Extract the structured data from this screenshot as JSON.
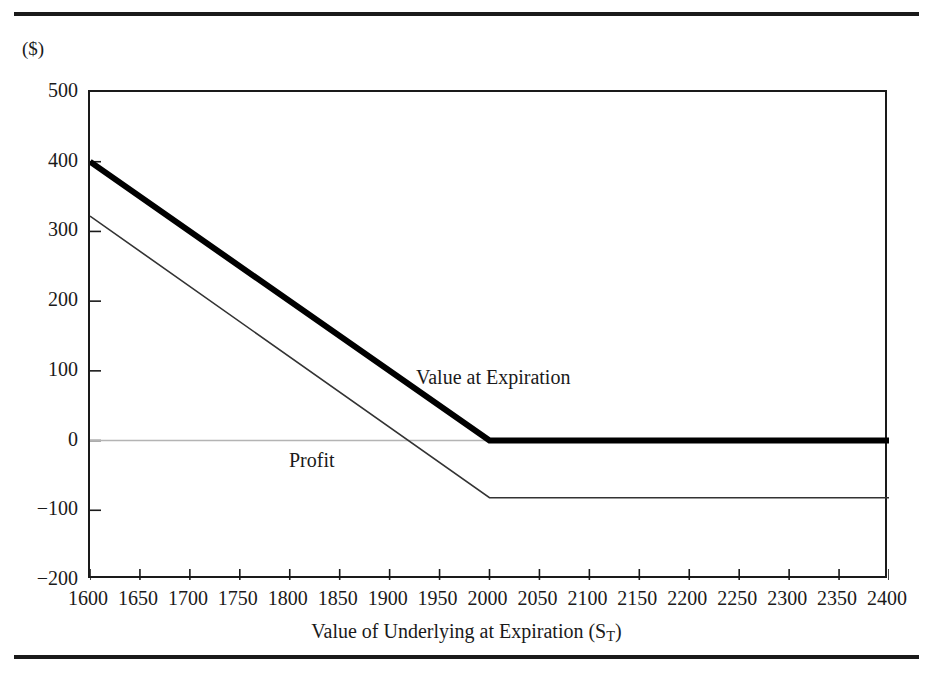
{
  "figure": {
    "clipped_title": "Exhibit  Short Call",
    "unit_label": "($)"
  },
  "chart_data": {
    "type": "line",
    "title": "",
    "xlabel": "Value of Underlying at Expiration (S",
    "xlabel_sub": "T",
    "xlabel_tail": ")",
    "ylabel": "($)",
    "xlim": [
      1600,
      2400
    ],
    "ylim": [
      -200,
      500
    ],
    "xticks": [
      1600,
      1650,
      1700,
      1750,
      1800,
      1850,
      1900,
      1950,
      2000,
      2050,
      2100,
      2150,
      2200,
      2250,
      2300,
      2350,
      2400
    ],
    "yticks": [
      500,
      400,
      300,
      200,
      100,
      0,
      -100,
      -200
    ],
    "grid": false,
    "zero_line": true,
    "zero_line_color": "#b4b4b4",
    "legend_position": "inline-annotation",
    "strike": 2000,
    "series": [
      {
        "name": "Value at Expiration",
        "color": "#000000",
        "width": 6,
        "label_x": 1930,
        "label_y": 225,
        "x": [
          1600,
          2000,
          2400
        ],
        "y": [
          400,
          0,
          0
        ]
      },
      {
        "name": "Profit",
        "color": "#333333",
        "width": 1.6,
        "label_x": 1720,
        "label_y": 105,
        "x": [
          1600,
          2000,
          2400
        ],
        "y": [
          322,
          -82,
          -82
        ]
      }
    ]
  }
}
